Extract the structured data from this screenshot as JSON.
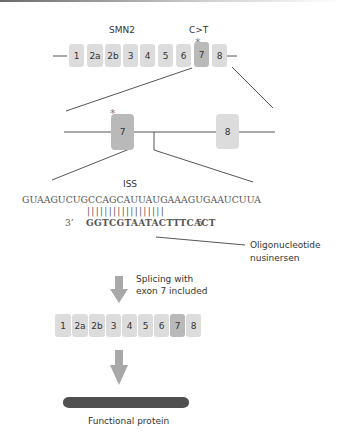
{
  "gene": {
    "name": "SMN2",
    "mutation": "C>T",
    "exons": [
      "1",
      "2a",
      "2b",
      "3",
      "4",
      "5",
      "6",
      "7",
      "8"
    ],
    "highlighted_exon": "7",
    "mutation_marker": "*"
  },
  "zoom_view": {
    "exons": [
      "7",
      "8"
    ],
    "mutation_marker": "*"
  },
  "sequence": {
    "region_label": "ISS",
    "rna": "GUAAGUCUGCCAGCAUUAUGAAAGUGAAUCUUA",
    "pairing_bars": "||||||||||||||||||",
    "oligo_3prime": "3’",
    "oligo": "GGTCGTAATACTTTCACT",
    "oligo_5prime": "5’",
    "oligo_label_line1": "Oligonucleotide",
    "oligo_label_line2": "nusinersen"
  },
  "step": {
    "label_line1": "Splicing with",
    "label_line2": "exon 7 included"
  },
  "mrna": {
    "exons": [
      "1",
      "2a",
      "2b",
      "3",
      "4",
      "5",
      "6",
      "7",
      "8"
    ],
    "highlighted_exon": "7"
  },
  "result": {
    "label": "Functional protein"
  },
  "colors": {
    "exon": "#dcdcdc",
    "exon_highlight": "#b9b9b9",
    "arrow": "#a8a8a8",
    "protein": "#505050",
    "line": "#555555"
  }
}
